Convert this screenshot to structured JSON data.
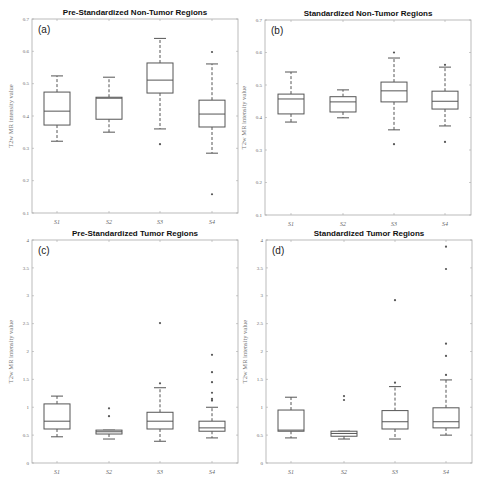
{
  "figure": {
    "ylabel": "T2w MR intensity value"
  },
  "chart_data": [
    {
      "type": "box",
      "panel": "(a)",
      "title": "Pre-Standardized Non-Tumor Regions",
      "xlabel": "",
      "ylabel": "T2w MR intensity value",
      "ylim": [
        0.1,
        0.7
      ],
      "yticks": [
        0.1,
        0.2,
        0.3,
        0.4,
        0.5,
        0.6,
        0.7
      ],
      "ytick_labels": [
        "0.1",
        "0.2",
        "0.3",
        "0.4",
        "0.5",
        "0.6",
        "0.7"
      ],
      "categories": [
        "S1",
        "S2",
        "S3",
        "S4"
      ],
      "boxes": [
        {
          "whisker_low": 0.322,
          "q1": 0.372,
          "median": 0.415,
          "q3": 0.474,
          "whisker_high": 0.524,
          "outliers": []
        },
        {
          "whisker_low": 0.35,
          "q1": 0.39,
          "median": 0.455,
          "q3": 0.458,
          "whisker_high": 0.52,
          "outliers": []
        },
        {
          "whisker_low": 0.36,
          "q1": 0.471,
          "median": 0.511,
          "q3": 0.564,
          "whisker_high": 0.64,
          "outliers": [
            0.313
          ]
        },
        {
          "whisker_low": 0.285,
          "q1": 0.366,
          "median": 0.406,
          "q3": 0.449,
          "whisker_high": 0.561,
          "outliers": [
            0.598,
            0.158
          ]
        }
      ],
      "grid": false
    },
    {
      "type": "box",
      "panel": "(b)",
      "title": "Standardized Non-Tumor Regions",
      "xlabel": "",
      "ylabel": "T2w MR intensity value",
      "ylim": [
        0.1,
        0.7
      ],
      "yticks": [
        0.1,
        0.2,
        0.3,
        0.4,
        0.5,
        0.6,
        0.7
      ],
      "ytick_labels": [
        "0.1",
        "0.2",
        "0.3",
        "0.4",
        "0.5",
        "0.6",
        "0.7"
      ],
      "categories": [
        "S1",
        "S2",
        "S3",
        "S4"
      ],
      "boxes": [
        {
          "whisker_low": 0.386,
          "q1": 0.411,
          "median": 0.457,
          "q3": 0.472,
          "whisker_high": 0.54,
          "outliers": []
        },
        {
          "whisker_low": 0.399,
          "q1": 0.417,
          "median": 0.448,
          "q3": 0.464,
          "whisker_high": 0.485,
          "outliers": []
        },
        {
          "whisker_low": 0.362,
          "q1": 0.448,
          "median": 0.482,
          "q3": 0.509,
          "whisker_high": 0.583,
          "outliers": [
            0.6,
            0.318
          ]
        },
        {
          "whisker_low": 0.374,
          "q1": 0.426,
          "median": 0.45,
          "q3": 0.481,
          "whisker_high": 0.555,
          "outliers": [
            0.562,
            0.325
          ]
        }
      ],
      "grid": false
    },
    {
      "type": "box",
      "panel": "(c)",
      "title": "Pre-Standardized Tumor Regions",
      "xlabel": "",
      "ylabel": "T2w MR intensity value",
      "ylim": [
        0,
        4
      ],
      "yticks": [
        0,
        0.5,
        1,
        1.5,
        2,
        2.5,
        3,
        3.5,
        4
      ],
      "ytick_labels": [
        "0",
        "0.5",
        "1",
        "1.5",
        "2",
        "2.5",
        "3",
        "3.5",
        "4"
      ],
      "categories": [
        "S1",
        "S2",
        "S3",
        "S4"
      ],
      "boxes": [
        {
          "whisker_low": 0.47,
          "q1": 0.61,
          "median": 0.75,
          "q3": 1.06,
          "whisker_high": 1.2,
          "outliers": []
        },
        {
          "whisker_low": 0.43,
          "q1": 0.52,
          "median": 0.56,
          "q3": 0.59,
          "whisker_high": 0.59,
          "outliers": [
            0.98,
            0.84
          ]
        },
        {
          "whisker_low": 0.39,
          "q1": 0.61,
          "median": 0.75,
          "q3": 0.91,
          "whisker_high": 1.35,
          "outliers": [
            2.51,
            1.43
          ]
        },
        {
          "whisker_low": 0.45,
          "q1": 0.57,
          "median": 0.63,
          "q3": 0.75,
          "whisker_high": 1.0,
          "outliers": [
            1.94,
            1.63,
            1.45,
            1.26,
            1.15,
            1.12
          ]
        }
      ],
      "grid": false
    },
    {
      "type": "box",
      "panel": "(d)",
      "title": "Standardized Tumor Regions",
      "xlabel": "",
      "ylabel": "T2w MR intensity value",
      "ylim": [
        0,
        4
      ],
      "yticks": [
        0,
        0.5,
        1,
        1.5,
        2,
        2.5,
        3,
        3.5,
        4
      ],
      "ytick_labels": [
        "0",
        "0.5",
        "1",
        "1.5",
        "2",
        "2.5",
        "3",
        "3.5",
        "4"
      ],
      "categories": [
        "S1",
        "S2",
        "S3",
        "S4"
      ],
      "boxes": [
        {
          "whisker_low": 0.45,
          "q1": 0.57,
          "median": 0.59,
          "q3": 0.95,
          "whisker_high": 1.18,
          "outliers": []
        },
        {
          "whisker_low": 0.43,
          "q1": 0.48,
          "median": 0.53,
          "q3": 0.57,
          "whisker_high": 0.57,
          "outliers": [
            1.2,
            1.13
          ]
        },
        {
          "whisker_low": 0.43,
          "q1": 0.61,
          "median": 0.74,
          "q3": 0.94,
          "whisker_high": 1.37,
          "outliers": [
            2.92,
            1.44
          ]
        },
        {
          "whisker_low": 0.5,
          "q1": 0.63,
          "median": 0.74,
          "q3": 0.99,
          "whisker_high": 1.49,
          "outliers": [
            3.88,
            3.48,
            2.14,
            1.92,
            1.58
          ]
        }
      ],
      "grid": false
    }
  ],
  "layout": {
    "panels": [
      {
        "x0": 32,
        "x1": 238,
        "y0": 19,
        "y1": 213,
        "box_centers": [
          57,
          109,
          160,
          212
        ]
      },
      {
        "x0": 265,
        "x1": 471,
        "y0": 20,
        "y1": 215,
        "box_centers": [
          291,
          343,
          394,
          445
        ]
      },
      {
        "x0": 32,
        "x1": 238,
        "y0": 240,
        "y1": 463,
        "box_centers": [
          57,
          109,
          160,
          212
        ]
      },
      {
        "x0": 266,
        "x1": 472,
        "y0": 240,
        "y1": 463,
        "box_centers": [
          291,
          344,
          395,
          446
        ]
      }
    ],
    "box_width": 26
  }
}
